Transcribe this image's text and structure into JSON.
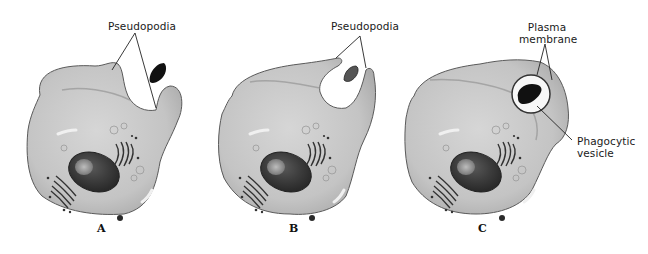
{
  "figure": {
    "panels": [
      {
        "id": "A",
        "letter": "A",
        "labels": [
          {
            "text": "Pseudopodia",
            "points_to": [
              "left pseudopod tip",
              "right pseudopod tip"
            ]
          }
        ],
        "stage": "Pseudopodia extend toward particle"
      },
      {
        "id": "B",
        "letter": "B",
        "labels": [
          {
            "text": "Pseudopodia",
            "points_to": [
              "left pseudopod tip",
              "right pseudopod tip"
            ]
          }
        ],
        "stage": "Pseudopodia surround particle"
      },
      {
        "id": "C",
        "letter": "C",
        "labels": [
          {
            "text_line1": "Plasma",
            "text_line2": "membrane",
            "points_to": [
              "vesicle membrane",
              "cell surface"
            ]
          },
          {
            "text_line1": "Phagocytic",
            "text_line2": "vesicle",
            "points_to": [
              "vesicle"
            ]
          }
        ],
        "stage": "Particle enclosed in phagocytic vesicle"
      }
    ],
    "colors": {
      "background": "#ffffff",
      "cell_fill": "#c9c9c9",
      "cell_edge": "#555555",
      "particle": "#111111",
      "nucleus": "#3a3a3a",
      "label_text": "#1a1a1a"
    }
  }
}
